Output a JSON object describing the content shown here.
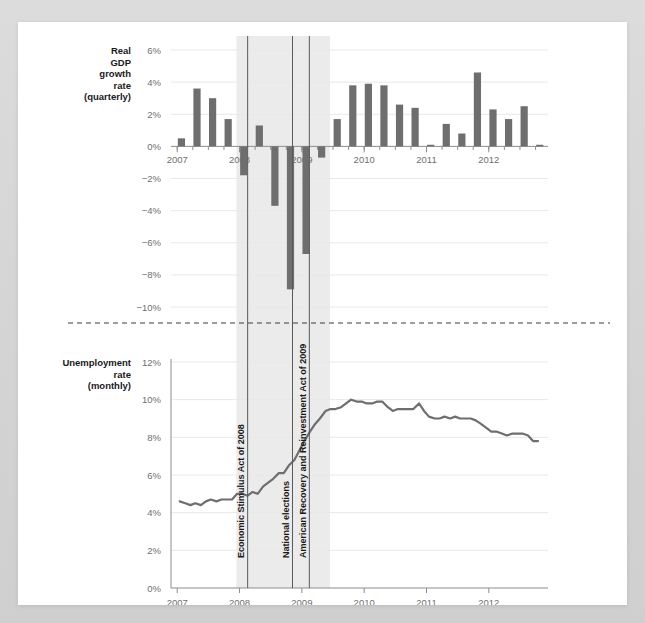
{
  "figure": {
    "background_color": "#d9d9d9",
    "canvas_color": "#ffffff",
    "bar_color": "#6e6e6e",
    "line_color": "#6e6e6e",
    "band_color": "#ebebeb",
    "grid_color": "#e8e8e8",
    "axis_color": "#8c8c8c"
  },
  "panels": {
    "gdp": {
      "title_lines": [
        "Real",
        "GDP",
        "growth",
        "rate",
        "(quarterly)"
      ],
      "title": "Real GDP growth rate (quarterly)",
      "ytick_labels": [
        "6%",
        "4%",
        "2%",
        "0%",
        "−2%",
        "−4%",
        "−6%",
        "−8%",
        "−10%"
      ],
      "xtick_labels": [
        "2007",
        "2008",
        "2009",
        "2010",
        "2011",
        "2012"
      ]
    },
    "unemployment": {
      "title_lines": [
        "Unemployment",
        "rate",
        "(monthly)"
      ],
      "title": "Unemployment rate (monthly)",
      "ytick_labels": [
        "12%",
        "10%",
        "8%",
        "6%",
        "4%",
        "2%",
        "0%"
      ],
      "xtick_labels": [
        "2007",
        "2008",
        "2009",
        "2010",
        "2011",
        "2012"
      ]
    }
  },
  "annotations": [
    {
      "label": "Economic Stimulus Act of 2008",
      "x_value": 2008.13
    },
    {
      "label": "National elections",
      "x_value": 2008.85
    },
    {
      "label": "American Recovery and Reinvestment Act of 2009",
      "x_value": 2009.12
    }
  ],
  "recession_band": {
    "start": 2007.95,
    "end": 2009.45,
    "label": "recession shading"
  },
  "chart_data": [
    {
      "type": "bar",
      "id": "real-gdp-growth",
      "title": "Real GDP growth rate (quarterly)",
      "xlabel": "",
      "ylabel": "Real GDP growth rate (quarterly)",
      "ylim": [
        -10,
        6
      ],
      "xlim": [
        2006.9,
        2012.95
      ],
      "grid": true,
      "yticks": [
        6,
        4,
        2,
        0,
        -2,
        -4,
        -6,
        -8,
        -10
      ],
      "ytick_labels": [
        "6%",
        "4%",
        "2%",
        "0%",
        "−2%",
        "−4%",
        "−6%",
        "−8%",
        "−10%"
      ],
      "xticks": [
        2007,
        2008,
        2009,
        2010,
        2011,
        2012
      ],
      "x": [
        2007.0,
        2007.25,
        2007.5,
        2007.75,
        2008.0,
        2008.25,
        2008.5,
        2008.75,
        2009.0,
        2009.25,
        2009.5,
        2009.75,
        2010.0,
        2010.25,
        2010.5,
        2010.75,
        2011.0,
        2011.25,
        2011.5,
        2011.75,
        2012.0,
        2012.25,
        2012.5,
        2012.75
      ],
      "categories": [
        "2007 Q1",
        "2007 Q2",
        "2007 Q3",
        "2007 Q4",
        "2008 Q1",
        "2008 Q2",
        "2008 Q3",
        "2008 Q4",
        "2009 Q1",
        "2009 Q2",
        "2009 Q3",
        "2009 Q4",
        "2010 Q1",
        "2010 Q2",
        "2010 Q3",
        "2010 Q4",
        "2011 Q1",
        "2011 Q2",
        "2011 Q3",
        "2011 Q4",
        "2012 Q1",
        "2012 Q2",
        "2012 Q3",
        "2012 Q4"
      ],
      "values": [
        0.5,
        3.6,
        3.0,
        1.7,
        -1.8,
        1.3,
        -3.7,
        -8.9,
        -6.7,
        -0.7,
        1.7,
        3.8,
        3.9,
        3.8,
        2.6,
        2.4,
        0.1,
        1.4,
        0.8,
        4.6,
        2.3,
        1.7,
        2.5,
        0.1
      ]
    },
    {
      "type": "line",
      "id": "unemployment-rate",
      "title": "Unemployment rate (monthly)",
      "xlabel": "",
      "ylabel": "Unemployment rate (monthly)",
      "ylim": [
        0,
        12.6
      ],
      "xlim": [
        2006.9,
        2012.95
      ],
      "grid": true,
      "yticks": [
        12,
        10,
        8,
        6,
        4,
        2,
        0
      ],
      "ytick_labels": [
        "12%",
        "10%",
        "8%",
        "6%",
        "4%",
        "2%",
        "0%"
      ],
      "xticks": [
        2007,
        2008,
        2009,
        2010,
        2011,
        2012
      ],
      "x": [
        2007.04,
        2007.13,
        2007.21,
        2007.29,
        2007.38,
        2007.46,
        2007.54,
        2007.63,
        2007.71,
        2007.79,
        2007.88,
        2007.96,
        2008.04,
        2008.13,
        2008.21,
        2008.29,
        2008.38,
        2008.46,
        2008.54,
        2008.63,
        2008.71,
        2008.79,
        2008.88,
        2008.96,
        2009.04,
        2009.13,
        2009.21,
        2009.29,
        2009.38,
        2009.46,
        2009.54,
        2009.63,
        2009.71,
        2009.79,
        2009.88,
        2009.96,
        2010.04,
        2010.13,
        2010.21,
        2010.29,
        2010.38,
        2010.46,
        2010.54,
        2010.63,
        2010.71,
        2010.79,
        2010.88,
        2010.96,
        2011.04,
        2011.13,
        2011.21,
        2011.29,
        2011.38,
        2011.46,
        2011.54,
        2011.63,
        2011.71,
        2011.79,
        2011.88,
        2011.96,
        2012.04,
        2012.13,
        2012.21,
        2012.29,
        2012.38,
        2012.46,
        2012.54,
        2012.63,
        2012.71,
        2012.79
      ],
      "values": [
        4.6,
        4.5,
        4.4,
        4.5,
        4.4,
        4.6,
        4.7,
        4.6,
        4.7,
        4.7,
        4.7,
        5.0,
        5.0,
        4.9,
        5.1,
        5.0,
        5.4,
        5.6,
        5.8,
        6.1,
        6.1,
        6.5,
        6.8,
        7.3,
        7.8,
        8.3,
        8.7,
        9.0,
        9.4,
        9.5,
        9.5,
        9.6,
        9.8,
        10.0,
        9.9,
        9.9,
        9.8,
        9.8,
        9.9,
        9.9,
        9.6,
        9.4,
        9.5,
        9.5,
        9.5,
        9.5,
        9.8,
        9.4,
        9.1,
        9.0,
        9.0,
        9.1,
        9.0,
        9.1,
        9.0,
        9.0,
        9.0,
        8.9,
        8.7,
        8.5,
        8.3,
        8.3,
        8.2,
        8.1,
        8.2,
        8.2,
        8.2,
        8.1,
        7.8,
        7.8
      ]
    }
  ]
}
